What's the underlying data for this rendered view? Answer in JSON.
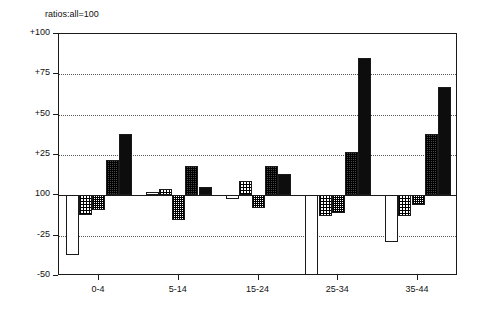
{
  "chart_data": {
    "type": "bar",
    "title": "ratios:all=100",
    "xlabel": "",
    "ylabel": "",
    "baseline": 100,
    "ylim": [
      -50,
      100
    ],
    "yticks": [
      {
        "value": 100,
        "label": "+100"
      },
      {
        "value": 75,
        "label": "+75"
      },
      {
        "value": 50,
        "label": "+50"
      },
      {
        "value": 25,
        "label": "+25"
      },
      {
        "value": 0,
        "label": "100"
      },
      {
        "value": -25,
        "label": "-25"
      },
      {
        "value": -50,
        "label": "-50"
      }
    ],
    "grid": true,
    "grid_axis": "y",
    "legend": "none",
    "categories": [
      "0-4",
      "5-14",
      "15-24",
      "25-34",
      "35-44"
    ],
    "series": [
      {
        "name": "series-1",
        "pattern": "hollow",
        "values": [
          -37,
          2,
          -2,
          -55,
          -29
        ]
      },
      {
        "name": "series-2",
        "pattern": "light",
        "values": [
          -12,
          4,
          9,
          -13,
          -13
        ]
      },
      {
        "name": "series-3",
        "pattern": "medium",
        "values": [
          -9,
          -15,
          -8,
          -11,
          -6
        ]
      },
      {
        "name": "series-4",
        "pattern": "dark",
        "values": [
          22,
          18,
          18,
          27,
          38
        ]
      },
      {
        "name": "series-5",
        "pattern": "solid",
        "values": [
          38,
          5,
          13,
          85,
          67
        ]
      }
    ]
  }
}
